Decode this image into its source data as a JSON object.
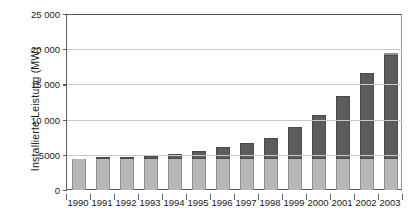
{
  "chart_data": {
    "type": "bar",
    "stacked": true,
    "title": "",
    "subtitle": "",
    "xlabel": "",
    "ylabel": "Installierte Leistung (MW)",
    "ylim": [
      0,
      25000
    ],
    "ytick_labels": [
      "0",
      "5000",
      "10 000",
      "15 000",
      "20 000",
      "25 000"
    ],
    "ytick_values": [
      0,
      5000,
      10000,
      15000,
      20000,
      25000
    ],
    "grid": true,
    "legend": "none",
    "categories": [
      "1990",
      "1991",
      "1992",
      "1993",
      "1994",
      "1995",
      "1996",
      "1997",
      "1998",
      "1999",
      "2000",
      "2001",
      "2002",
      "2003"
    ],
    "series": [
      {
        "name": "untere Komponente",
        "color": "#b8b8b8",
        "values": [
          4430,
          4430,
          4430,
          4430,
          4430,
          4430,
          4430,
          4430,
          4430,
          4430,
          4430,
          4430,
          4430,
          4430
        ]
      },
      {
        "name": "obere Komponente",
        "color": "#5c5c5c",
        "values": [
          0,
          30,
          230,
          470,
          730,
          1150,
          1640,
          2270,
          3000,
          4510,
          6170,
          8970,
          12210,
          14770
        ]
      },
      {
        "name": "Abschluss",
        "color": "#e4e4e4",
        "values": [
          0,
          0,
          0,
          0,
          0,
          0,
          0,
          0,
          0,
          0,
          0,
          0,
          0,
          300
        ]
      }
    ],
    "totals": [
      4430,
      4460,
      4660,
      4900,
      5160,
      5580,
      6070,
      6700,
      7430,
      8940,
      10600,
      13400,
      16640,
      19500
    ]
  },
  "axis": {
    "y_title": "Installierte Leistung (MW)"
  },
  "colors": {
    "segment_lower": "#b8b8b8",
    "segment_upper": "#5c5c5c",
    "segment_cap": "#e4e4e4",
    "grid": "#c9c9c9",
    "axis": "#5b5b5b",
    "text": "#1a1a1a",
    "background": "#ffffff"
  }
}
